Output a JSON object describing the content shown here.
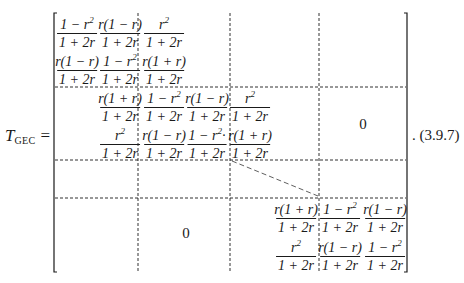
{
  "equation": {
    "lhs_symbol": "T",
    "lhs_subscript": "GEC",
    "equals": "=",
    "label": ". (3.9.7)"
  },
  "matrix": {
    "block_1": [
      [
        {
          "num": "1 − r²",
          "den": "1 + 2r"
        },
        {
          "num": "r(1 − r)",
          "den": "1 + 2r"
        },
        {
          "num": "r²",
          "den": "1 + 2r"
        }
      ],
      [
        {
          "num": "r(1 − r)",
          "den": "1 + 2r"
        },
        {
          "num": "1 − r²",
          "den": "1 + 2r"
        },
        {
          "num": "r(1 + r)",
          "den": "1 + 2r"
        }
      ]
    ],
    "block_2": [
      [
        {
          "num": "r(1 + r)",
          "den": "1 + 2r"
        },
        {
          "num": "1 − r²",
          "den": "1 + 2r"
        },
        {
          "num": "r(1 − r)",
          "den": "1 + 2r"
        },
        {
          "num": "r²",
          "den": "1 + 2r"
        }
      ],
      [
        {
          "num": "r²",
          "den": "1 + 2r"
        },
        {
          "num": "r(1 − r)",
          "den": "1 + 2r"
        },
        {
          "num": "1 − r²·",
          "den": "1 + 2r"
        },
        {
          "num": "r(1 + r)",
          "den": "1 + 2r"
        }
      ]
    ],
    "block_last": [
      [
        {
          "num": "r(1 + r)",
          "den": "1 + 2r"
        },
        {
          "num": "1 − r²",
          "den": "1 + 2r"
        },
        {
          "num": "r(1 − r)",
          "den": "1 + 2r"
        }
      ],
      [
        {
          "num": "r²",
          "den": "1 + 2r"
        },
        {
          "num": "r(1 − r)",
          "den": "1 + 2r"
        },
        {
          "num": "1 − r²",
          "den": "1 + 2r"
        }
      ]
    ],
    "zero_upper_right": "0",
    "zero_lower_left": "0"
  }
}
